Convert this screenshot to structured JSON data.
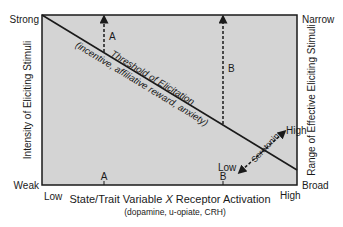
{
  "diagram": {
    "y_axis_left": {
      "label": "Intensity of Eliciting Stimuli",
      "top": "Strong",
      "bottom": "Weak"
    },
    "y_axis_right": {
      "label": "Range of Effective Eliciting Stimuli",
      "top": "Narrow",
      "bottom": "Broad"
    },
    "x_axis": {
      "label": "State/Trait Variable X Receptor Activation",
      "label_prefix": "State/Trait Variable ",
      "label_var": "X",
      "label_suffix": " Receptor Activation",
      "sublabel": "(dopamine, u-opiate, CRH)",
      "left": "Low",
      "right": "High",
      "tick_a": "A",
      "tick_b": "B"
    },
    "threshold": {
      "line1": "Threshold of Elicitation",
      "line2": "(incentive, affiliative reward, anxiety)"
    },
    "arrows": {
      "a_label": "A",
      "b_label": "B"
    },
    "serotonin": {
      "label": "Serotonin",
      "high": "High",
      "low": "Low"
    },
    "colors": {
      "plot_bg": "#d4d4d4",
      "line": "#1a1a1a"
    }
  }
}
